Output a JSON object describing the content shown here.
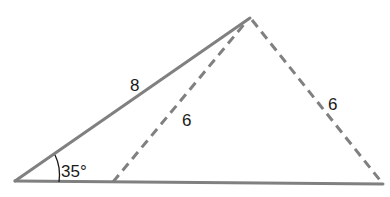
{
  "diagram": {
    "type": "triangle-ambiguous-case",
    "vertices": {
      "apex": [
        250,
        18
      ],
      "left": [
        15,
        181
      ],
      "right": [
        383,
        184
      ],
      "inner_foot": [
        113,
        182
      ]
    },
    "colors": {
      "solid_line": "#808080",
      "dashed_line": "#808080",
      "text": "#1a1a1a"
    },
    "labels": {
      "side_left": "8",
      "side_inner": "6",
      "side_right": "6",
      "angle": "35°"
    }
  }
}
